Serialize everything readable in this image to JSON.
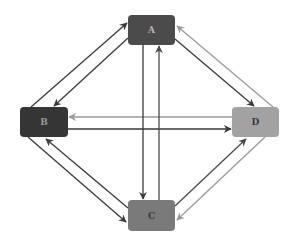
{
  "diagram": {
    "type": "directed-graph",
    "nodes": [
      {
        "id": "A",
        "label": "A",
        "x": 128,
        "y": 15,
        "w": 47,
        "h": 30,
        "fill": "#4b4b4b",
        "text_color": "#b8b8b8"
      },
      {
        "id": "B",
        "label": "B",
        "x": 20,
        "y": 107,
        "w": 48,
        "h": 30,
        "fill": "#353535",
        "text_color": "#9a9a9a"
      },
      {
        "id": "C",
        "label": "C",
        "x": 128,
        "y": 200,
        "w": 47,
        "h": 31,
        "fill": "#7a7a7a",
        "text_color": "#3a3a3a"
      },
      {
        "id": "D",
        "label": "D",
        "x": 232,
        "y": 107,
        "w": 47,
        "h": 30,
        "fill": "#a2a2a2",
        "text_color": "#3a3a3a"
      }
    ],
    "edges": [
      {
        "from": "B",
        "to": "A",
        "x1": 31,
        "y1": 107,
        "x2": 127,
        "y2": 23,
        "color": "#3a3a3a"
      },
      {
        "from": "A",
        "to": "B",
        "x1": 128,
        "y1": 38,
        "x2": 54,
        "y2": 106,
        "color": "#3a3a3a"
      },
      {
        "from": "A",
        "to": "D",
        "x1": 175,
        "y1": 39,
        "x2": 254,
        "y2": 106,
        "color": "#3a3a3a"
      },
      {
        "from": "D",
        "to": "A",
        "x1": 273,
        "y1": 107,
        "x2": 177,
        "y2": 26,
        "color": "#9a9a9a"
      },
      {
        "from": "B",
        "to": "D",
        "x1": 68,
        "y1": 129,
        "x2": 231,
        "y2": 129,
        "color": "#3a3a3a"
      },
      {
        "from": "D",
        "to": "B",
        "x1": 232,
        "y1": 117,
        "x2": 69,
        "y2": 117,
        "color": "#9a9a9a"
      },
      {
        "from": "A",
        "to": "C",
        "x1": 143,
        "y1": 45,
        "x2": 143,
        "y2": 199,
        "color": "#3a3a3a"
      },
      {
        "from": "C",
        "to": "A",
        "x1": 159,
        "y1": 200,
        "x2": 159,
        "y2": 46,
        "color": "#4a4a4a"
      },
      {
        "from": "B",
        "to": "C",
        "x1": 28,
        "y1": 137,
        "x2": 126,
        "y2": 222,
        "color": "#3a3a3a"
      },
      {
        "from": "C",
        "to": "B",
        "x1": 128,
        "y1": 208,
        "x2": 46,
        "y2": 139,
        "color": "#3a3a3a"
      },
      {
        "from": "C",
        "to": "D",
        "x1": 175,
        "y1": 206,
        "x2": 246,
        "y2": 139,
        "color": "#4a4a4a"
      },
      {
        "from": "D",
        "to": "C",
        "x1": 265,
        "y1": 137,
        "x2": 177,
        "y2": 220,
        "color": "#9a9a9a"
      }
    ]
  }
}
